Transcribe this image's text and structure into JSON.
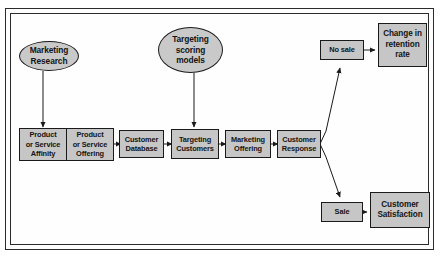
{
  "diagram": {
    "colors": {
      "node_fill": "#c6c6c6",
      "ellipse_fill": "#c9c9c9",
      "stroke": "#1a1a1a",
      "background": "#ffffff"
    },
    "ellipses": [
      {
        "id": "marketing-research",
        "lines": [
          "Marketing",
          "Research"
        ]
      },
      {
        "id": "targeting-scoring-models",
        "lines": [
          "Targeting",
          "scoring",
          "models"
        ]
      }
    ],
    "process_chain": [
      {
        "id": "product-or-service-affinity",
        "lines": [
          "Product",
          "or Service",
          "Affinity"
        ]
      },
      {
        "id": "product-or-service-offering",
        "lines": [
          "Product",
          "or Service",
          "Offering"
        ]
      },
      {
        "id": "customer-database",
        "lines": [
          "Customer",
          "Database"
        ]
      },
      {
        "id": "targeting-customers",
        "lines": [
          "Targeting",
          "Customers"
        ]
      },
      {
        "id": "marketing-offering",
        "lines": [
          "Marketing",
          "Offering"
        ]
      },
      {
        "id": "customer-response",
        "lines": [
          "Customer",
          "Response"
        ]
      }
    ],
    "outcomes": [
      {
        "id": "no-sale",
        "lines": [
          "No sale"
        ]
      },
      {
        "id": "change-in-retention-rate",
        "lines": [
          "Change in",
          "retention",
          "rate"
        ]
      },
      {
        "id": "sale",
        "lines": [
          "Sale"
        ]
      },
      {
        "id": "customer-satisfaction",
        "lines": [
          "Customer",
          "Satisfaction"
        ]
      }
    ]
  }
}
